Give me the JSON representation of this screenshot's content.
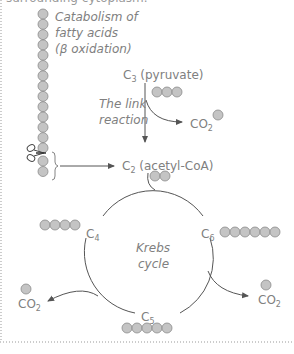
{
  "header": {
    "cut_text": "surrounding cytoplasm."
  },
  "fatty_acid": {
    "label_lines": [
      "Catabolism of",
      "fatty acids",
      "(β oxidation)"
    ],
    "beads_above_cut": 14,
    "beads_below_cut": 2
  },
  "pyruvate": {
    "label": "C",
    "sub": "3",
    "suffix": " (pyruvate)",
    "beads": 3
  },
  "link_reaction": {
    "lines": [
      "The link",
      "reaction"
    ]
  },
  "co2_top": {
    "label": "CO",
    "sub": "2",
    "beads": 1
  },
  "acetyl": {
    "label": "C",
    "sub": "2",
    "suffix": " (acetyl-CoA)",
    "beads": 2
  },
  "krebs": {
    "lines": [
      "Krebs",
      "cycle"
    ],
    "c4": {
      "label": "C",
      "sub": "4",
      "beads": 4
    },
    "c6": {
      "label": "C",
      "sub": "6",
      "beads": 6
    },
    "c5": {
      "label": "C",
      "sub": "5",
      "beads": 5
    }
  },
  "co2_left": {
    "label": "CO",
    "sub": "2",
    "beads": 1
  },
  "co2_right": {
    "label": "CO",
    "sub": "2",
    "beads": 1
  },
  "colors": {
    "bead_fill": "#c4c4c4",
    "bead_stroke": "#8a8a8a",
    "line": "#555555",
    "text": "#808080"
  }
}
